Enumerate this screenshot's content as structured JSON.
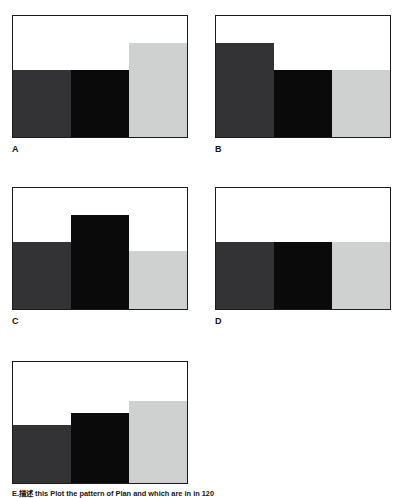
{
  "figure": {
    "caption": "E.描述 this Plot the pattern of Plan and which are in in 120",
    "background": "#ffffff",
    "frame_color": "#1b1b1b"
  },
  "colors": {
    "dark_gray": "#333336",
    "black": "#0a0a0a",
    "light_gray": "#cfd0d0"
  },
  "chart_data": [
    {
      "type": "bar",
      "title": "A",
      "categories": [
        "bar-1",
        "bar-2",
        "bar-3"
      ],
      "values": [
        55,
        55,
        78
      ],
      "colors": [
        "#333336",
        "#0a0a0a",
        "#cfd0d0"
      ],
      "ylim": [
        0,
        100
      ],
      "xlabel": "",
      "ylabel": "",
      "grid": false,
      "legend": "none",
      "pattern": "first two equal, third tallest"
    },
    {
      "type": "bar",
      "title": "B",
      "categories": [
        "bar-1",
        "bar-2",
        "bar-3"
      ],
      "values": [
        78,
        55,
        55
      ],
      "colors": [
        "#333336",
        "#0a0a0a",
        "#cfd0d0"
      ],
      "ylim": [
        0,
        100
      ],
      "xlabel": "",
      "ylabel": "",
      "grid": false,
      "legend": "none",
      "pattern": "first tallest, last two equal"
    },
    {
      "type": "bar",
      "title": "C",
      "categories": [
        "bar-1",
        "bar-2",
        "bar-3"
      ],
      "values": [
        55,
        78,
        48
      ],
      "colors": [
        "#333336",
        "#0a0a0a",
        "#cfd0d0"
      ],
      "ylim": [
        0,
        100
      ],
      "xlabel": "",
      "ylabel": "",
      "grid": false,
      "legend": "none",
      "pattern": "middle tallest, peaked"
    },
    {
      "type": "bar",
      "title": "D",
      "categories": [
        "bar-1",
        "bar-2",
        "bar-3"
      ],
      "values": [
        55,
        55,
        55
      ],
      "colors": [
        "#333336",
        "#0a0a0a",
        "#cfd0d0"
      ],
      "ylim": [
        0,
        100
      ],
      "xlabel": "",
      "ylabel": "",
      "grid": false,
      "legend": "none",
      "pattern": "all three equal"
    },
    {
      "type": "bar",
      "title": "E",
      "categories": [
        "bar-1",
        "bar-2",
        "bar-3"
      ],
      "values": [
        48,
        58,
        68
      ],
      "colors": [
        "#333336",
        "#0a0a0a",
        "#cfd0d0"
      ],
      "ylim": [
        0,
        100
      ],
      "xlabel": "",
      "ylabel": "",
      "grid": false,
      "legend": "none",
      "pattern": "ascending staircase"
    }
  ],
  "panels": [
    {
      "label": "A"
    },
    {
      "label": "B"
    },
    {
      "label": "C"
    },
    {
      "label": "D"
    },
    {
      "label": "E"
    }
  ]
}
